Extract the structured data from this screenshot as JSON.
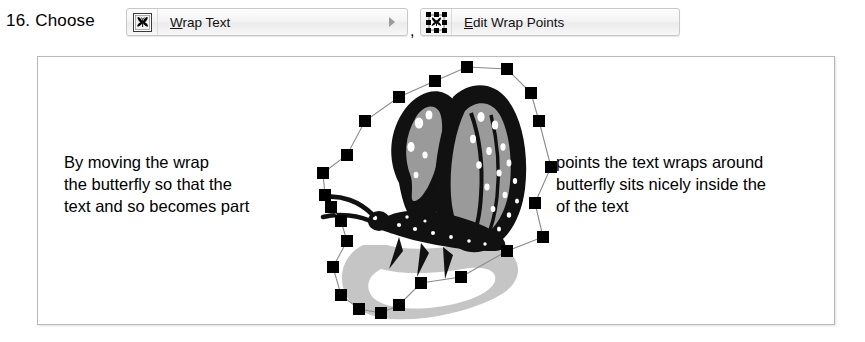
{
  "step": {
    "number_label": "16. Choose"
  },
  "menu": {
    "items": [
      {
        "name": "wrap-text",
        "accel_letter": "W",
        "label_rest": "rap Text",
        "label_full": "Wrap Text",
        "icon": "wrap-text-icon",
        "has_submenu": true
      },
      {
        "name": "edit-wrap-points",
        "accel_letter": "E",
        "label_rest": "dit Wrap Points",
        "label_full": "Edit Wrap Points",
        "icon": "edit-wrap-points-icon",
        "has_submenu": false
      }
    ],
    "separator": ","
  },
  "content": {
    "text_left": "By moving the wrap\nthe butterfly so that the\ntext and so becomes part",
    "text_right": "points the text wraps around\nbutterfly sits nicely inside the\nof the text",
    "image": {
      "name": "butterfly-image",
      "alt": "monarch butterfly with wrap points",
      "shadow_alt": "butterfly shadow"
    }
  },
  "colors": {
    "text": "#000000",
    "frame_border": "#b9b9b9",
    "menu_border": "#c8c8c8",
    "handle_fill": "#000000",
    "handle_line": "#808080",
    "wing_dark": "#111111",
    "wing_mid": "#9a9a9a",
    "shadow_gray": "#c0c0c0"
  }
}
